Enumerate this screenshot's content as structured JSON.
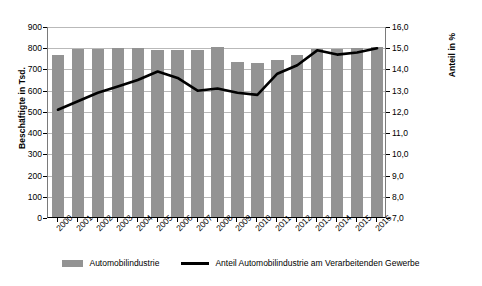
{
  "chart_data": {
    "type": "bar",
    "title": "",
    "subtitle": "",
    "xlabel": "",
    "ylabel": "Beschäftigte in Tsd.",
    "y2label": "Anteil in %",
    "grid": true,
    "legend_position": "bottom",
    "categories": [
      "2000",
      "2001",
      "2002",
      "2003",
      "2004",
      "2005",
      "2006",
      "2007",
      "2008",
      "2009",
      "2010",
      "2011",
      "2012",
      "2013",
      "2014",
      "2015",
      "2016"
    ],
    "ylim": [
      0,
      900
    ],
    "yticks": [
      "0",
      "100",
      "200",
      "300",
      "400",
      "500",
      "600",
      "700",
      "800",
      "900"
    ],
    "ytick_values": [
      0,
      100,
      200,
      300,
      400,
      500,
      600,
      700,
      800,
      900
    ],
    "y2lim": [
      7.0,
      16.0
    ],
    "y2ticks": [
      "7,0",
      "8,0",
      "9,0",
      "10,0",
      "11,0",
      "12,0",
      "13,0",
      "14,0",
      "15,0",
      "16,0"
    ],
    "y2tick_values": [
      7.0,
      8.0,
      9.0,
      10.0,
      11.0,
      12.0,
      13.0,
      14.0,
      15.0,
      16.0
    ],
    "series": [
      {
        "name": "Automobilindustrie",
        "type": "bar",
        "axis": "left",
        "color": "#939393",
        "values": [
          765,
          790,
          792,
          795,
          797,
          788,
          785,
          785,
          800,
          730,
          728,
          740,
          765,
          790,
          790,
          795,
          800
        ]
      },
      {
        "name": "Anteil Automobilindustrie am Verarbeitenden Gewerbe",
        "type": "line",
        "axis": "right",
        "color": "#000000",
        "values": [
          12.1,
          12.5,
          12.9,
          13.2,
          13.5,
          13.9,
          13.6,
          13.0,
          13.1,
          12.9,
          12.8,
          13.8,
          14.2,
          14.9,
          14.7,
          14.8,
          15.0
        ]
      }
    ]
  },
  "legend": {
    "items": [
      {
        "label": "Automobilindustrie",
        "marker": "bar-swatch",
        "color": "#939393"
      },
      {
        "label": "Anteil Automobilindustrie am Verarbeitenden Gewerbe",
        "marker": "line-swatch",
        "color": "#000000"
      }
    ]
  }
}
